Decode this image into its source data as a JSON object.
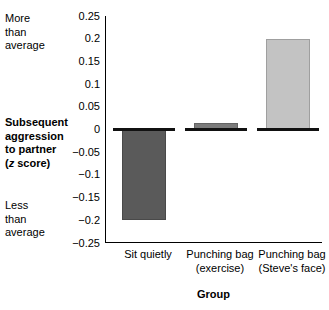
{
  "chart_data": {
    "type": "bar",
    "title": "",
    "xlabel": "Group",
    "ylabel": "Subsequent aggression to partner (z score)",
    "ylabel_lines": [
      "Subsequent",
      "aggression",
      "to partner",
      "(z score)"
    ],
    "categories": [
      "Sit quietly",
      "Punching bag (exercise)",
      "Punching bag (Steve's face)"
    ],
    "category_lines": [
      [
        "Sit quietly",
        ""
      ],
      [
        "Punching bag",
        "(exercise)"
      ],
      [
        "Punching bag",
        "(Steve's face)"
      ]
    ],
    "values": [
      -0.2,
      0.015,
      0.2
    ],
    "ylim": [
      -0.25,
      0.25
    ],
    "yticks": [
      0.25,
      0.2,
      0.15,
      0.1,
      0.05,
      0,
      -0.05,
      -0.1,
      -0.15,
      -0.2,
      -0.25
    ],
    "ytick_labels": [
      "0.25",
      "0.2",
      "0.15",
      "0.1",
      "0.05",
      "0",
      "−0.05",
      "−0.1",
      "−0.15",
      "−0.2",
      "−0.25"
    ],
    "grid": false,
    "legend": "none",
    "bar_colors": [
      "#5a5a5a",
      "#7b7b7b",
      "#c3c3c3"
    ],
    "annotations": {
      "top_anchor": [
        "More",
        "than",
        "average"
      ],
      "bottom_anchor": [
        "Less",
        "than",
        "average"
      ]
    }
  },
  "axis_notes": {
    "more_than_average": "More\nthan\naverage",
    "less_than_average": "Less\nthan\naverage"
  },
  "ylabel_parts": {
    "line1": "Subsequent",
    "line2": "aggression",
    "line3": "to partner",
    "line4_pre": "(",
    "line4_z": "z",
    "line4_post": " score)"
  }
}
